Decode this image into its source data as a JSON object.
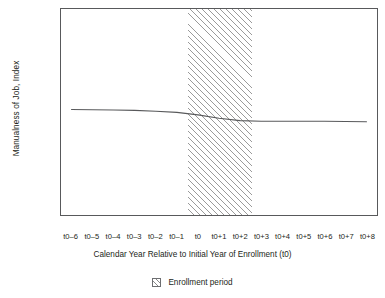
{
  "chart_data": {
    "type": "line",
    "title": "",
    "xlabel": "Calendar Year Relative to Initial Year of Enrollment (t0)",
    "ylabel": "Manualness of Job, Index",
    "categories": [
      "t0–6",
      "t0–5",
      "t0–4",
      "t0–3",
      "t0–2",
      "t0–1",
      "t0",
      "t0+1",
      "t0+2",
      "t0+3",
      "t0+4",
      "t0+5",
      "t0+6",
      "t0+7",
      "t0+8"
    ],
    "values": [
      0.012,
      0.011,
      0.01,
      0.008,
      0.004,
      -0.002,
      -0.014,
      -0.03,
      -0.042,
      -0.045,
      -0.045,
      -0.045,
      -0.045,
      -0.046,
      -0.047
    ],
    "series": [
      {
        "name": "Manualness of Job, Index",
        "values": [
          0.012,
          0.011,
          0.01,
          0.008,
          0.004,
          -0.002,
          -0.014,
          -0.03,
          -0.042,
          -0.045,
          -0.045,
          -0.045,
          -0.045,
          -0.046,
          -0.047
        ],
        "color": "#58595b"
      }
    ],
    "ylim": [
      -0.5,
      0.5
    ],
    "yticks": [
      0.5,
      0.25,
      0.0,
      -0.25,
      -0.5
    ],
    "ytick_labels": [
      "0.50%",
      "0.25%",
      "0.00%",
      "–0.25%",
      "–0.50%"
    ],
    "grid": false,
    "legend_position": "bottom",
    "legend": [
      {
        "label": "Enrollment period",
        "swatch": "hatched-square"
      }
    ],
    "shaded_region": {
      "label": "Enrollment period",
      "from_category": "t0",
      "to_category": "t0+2",
      "from_index": 5.5,
      "to_index": 8.5,
      "pattern": "diagonal-hatch",
      "color": "#9a9a9a"
    }
  }
}
